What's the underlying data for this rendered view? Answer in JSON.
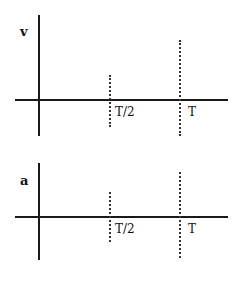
{
  "graphs": [
    {
      "name": "velocity-graph",
      "y_label": "v",
      "tick_labels": [
        "T/2",
        "T"
      ]
    },
    {
      "name": "acceleration-graph",
      "y_label": "a",
      "tick_labels": [
        "T/2",
        "T"
      ]
    }
  ],
  "colors": {
    "axis": "#1a1a1a",
    "dotted": "#333333",
    "background": "#ffffff"
  }
}
